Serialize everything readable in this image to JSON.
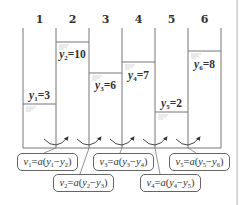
{
  "diagram": {
    "type": "water-columns-flux",
    "colors": {
      "line": "#777777",
      "text": "#333333",
      "box_border": "#666666",
      "background": "#ffffff"
    },
    "columns": [
      {
        "number": "1",
        "level_label": "y",
        "index": "1",
        "value": "3",
        "label_text": "y1=3"
      },
      {
        "number": "2",
        "level_label": "y",
        "index": "2",
        "value": "10",
        "label_text": "y2=10"
      },
      {
        "number": "3",
        "level_label": "y",
        "index": "3",
        "value": "6",
        "label_text": "y3=6"
      },
      {
        "number": "4",
        "level_label": "y",
        "index": "4",
        "value": "7",
        "label_text": "y4=7"
      },
      {
        "number": "5",
        "level_label": "y",
        "index": "5",
        "value": "2",
        "label_text": "y5=2"
      },
      {
        "number": "6",
        "level_label": "y",
        "index": "6",
        "value": "8",
        "label_text": "y6=8"
      }
    ],
    "fluxes": [
      {
        "v": "v",
        "i": "1",
        "a": "a",
        "yi": "1",
        "yj": "2",
        "text": "v1=a(y1−y2)"
      },
      {
        "v": "v",
        "i": "2",
        "a": "a",
        "yi": "2",
        "yj": "3",
        "text": "v2=a(y2−y3)"
      },
      {
        "v": "v",
        "i": "3",
        "a": "a",
        "yi": "3",
        "yj": "4",
        "text": "v3=a(y3−y4)"
      },
      {
        "v": "v",
        "i": "4",
        "a": "a",
        "yi": "4",
        "yj": "5",
        "text": "v4=a(y4−y5)"
      },
      {
        "v": "v",
        "i": "5",
        "a": "a",
        "yi": "5",
        "yj": "6",
        "text": "v5=a(y5−y6)"
      }
    ],
    "symbols": {
      "equals": "=",
      "minus": "−",
      "open": "(",
      "close": ")"
    },
    "arrow_icon": "curved-arrow-icon"
  }
}
